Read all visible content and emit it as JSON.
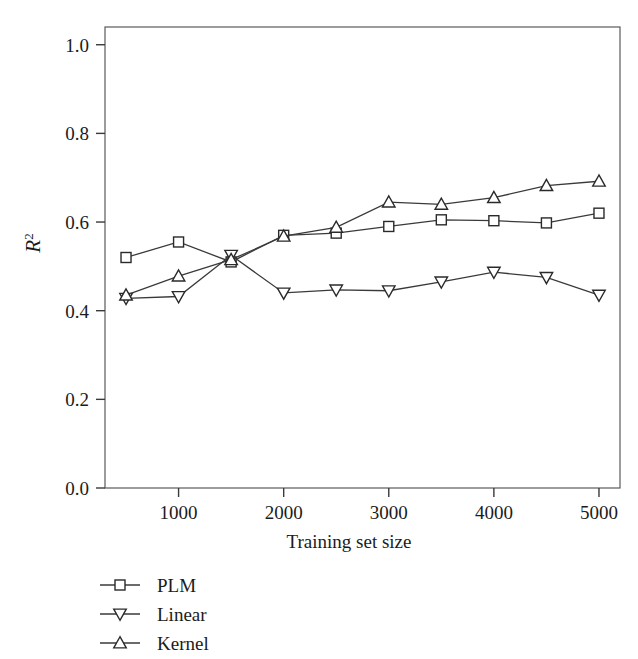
{
  "chart_data": {
    "type": "line",
    "title": "",
    "xlabel": "Training set size",
    "ylabel": "R²",
    "ylabel_base": "R",
    "ylabel_exponent": "2",
    "x": [
      500,
      1000,
      1500,
      2000,
      2500,
      3000,
      3500,
      4000,
      4500,
      5000
    ],
    "xlim": [
      300,
      5200
    ],
    "ylim": [
      0.0,
      1.04
    ],
    "xticks": [
      1000,
      2000,
      3000,
      4000,
      5000
    ],
    "xtick_labels": [
      "1000",
      "2000",
      "3000",
      "4000",
      "5000"
    ],
    "yticks": [
      0.0,
      0.2,
      0.4,
      0.6,
      0.8,
      1.0
    ],
    "ytick_labels": [
      "0.0",
      "0.2",
      "0.4",
      "0.6",
      "0.8",
      "1.0"
    ],
    "grid": false,
    "legend_position": "below-left",
    "line_color": "#3a3a3a",
    "marker_fill": "#ffffff",
    "marker_edge": "#2a2a2a",
    "series": [
      {
        "name": "PLM",
        "marker": "square",
        "values": [
          0.52,
          0.555,
          0.51,
          0.57,
          0.575,
          0.59,
          0.605,
          0.603,
          0.598,
          0.62
        ]
      },
      {
        "name": "Linear",
        "marker": "triangle-down",
        "values": [
          0.428,
          0.432,
          0.525,
          0.44,
          0.447,
          0.445,
          0.465,
          0.487,
          0.475,
          0.435
        ]
      },
      {
        "name": "Kernel",
        "marker": "triangle-up",
        "values": [
          0.435,
          0.478,
          0.515,
          0.568,
          0.588,
          0.645,
          0.64,
          0.655,
          0.682,
          0.692
        ]
      }
    ]
  },
  "legend": {
    "items": [
      {
        "label": "PLM",
        "marker": "square-marker"
      },
      {
        "label": "Linear",
        "marker": "triangle-down-marker"
      },
      {
        "label": "Kernel",
        "marker": "triangle-up-marker"
      }
    ]
  },
  "axes": {
    "x_title": "Training set size",
    "y_title_base": "R",
    "y_title_exponent": "2"
  }
}
